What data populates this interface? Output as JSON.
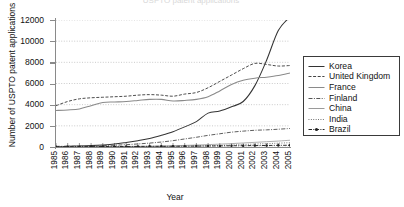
{
  "chart_data": {
    "type": "line",
    "title": "USPTO patent applications",
    "xlabel": "Year",
    "ylabel": "Number of USPTO patent applications",
    "xlim": [
      1985,
      2005
    ],
    "ylim": [
      0,
      12000
    ],
    "ytick_labels": [
      "12000",
      "10000",
      "8000",
      "6000",
      "4000",
      "2000",
      "0"
    ],
    "ytick_values": [
      12000,
      10000,
      8000,
      6000,
      4000,
      2000,
      0
    ],
    "grid": true,
    "legend_position": "right",
    "x": [
      1985,
      1986,
      1987,
      1988,
      1989,
      1990,
      1991,
      1992,
      1993,
      1994,
      1995,
      1996,
      1997,
      1998,
      1999,
      2000,
      2001,
      2002,
      2003,
      2004,
      2005
    ],
    "series": [
      {
        "name": "Korea",
        "style": "solid",
        "color": "#333333",
        "values": [
          40,
          60,
          90,
          130,
          190,
          280,
          430,
          600,
          800,
          1100,
          1450,
          1900,
          2400,
          3200,
          3400,
          3800,
          4300,
          5800,
          8200,
          11000,
          12300
        ]
      },
      {
        "name": "United Kingdom",
        "style": "dashed",
        "color": "#444444",
        "values": [
          3900,
          4300,
          4550,
          4650,
          4700,
          4750,
          4800,
          4900,
          4950,
          4900,
          4800,
          5000,
          5150,
          5600,
          6200,
          6800,
          7400,
          7900,
          7800,
          7650,
          7700
        ]
      },
      {
        "name": "France",
        "style": "solid",
        "color": "#8a8a8a",
        "values": [
          3450,
          3500,
          3600,
          3900,
          4200,
          4250,
          4300,
          4400,
          4500,
          4500,
          4350,
          4400,
          4500,
          4750,
          5300,
          5900,
          6300,
          6500,
          6600,
          6750,
          7000
        ]
      },
      {
        "name": "Finland",
        "style": "dash-dot",
        "color": "#555555",
        "values": [
          60,
          70,
          85,
          100,
          130,
          170,
          220,
          290,
          370,
          470,
          600,
          760,
          920,
          1100,
          1250,
          1400,
          1500,
          1580,
          1620,
          1680,
          1750
        ]
      },
      {
        "name": "China",
        "style": "solid-light",
        "color": "#9a9a9a",
        "values": [
          10,
          12,
          15,
          20,
          28,
          35,
          45,
          60,
          75,
          95,
          120,
          150,
          185,
          225,
          270,
          320,
          380,
          440,
          500,
          560,
          640
        ]
      },
      {
        "name": "India",
        "style": "dotted",
        "color": "#666666",
        "values": [
          8,
          9,
          10,
          12,
          15,
          18,
          22,
          28,
          35,
          45,
          58,
          75,
          95,
          120,
          150,
          190,
          235,
          280,
          320,
          360,
          410
        ]
      },
      {
        "name": "Brazil",
        "style": "dash-dot-marker",
        "color": "#222222",
        "values": [
          30,
          32,
          35,
          38,
          42,
          45,
          50,
          55,
          60,
          65,
          70,
          78,
          85,
          95,
          105,
          115,
          125,
          135,
          145,
          155,
          165
        ]
      }
    ],
    "legend": [
      {
        "label": "Korea",
        "style": "solid",
        "color": "#333333"
      },
      {
        "label": "United Kingdom",
        "style": "dashed",
        "color": "#444444"
      },
      {
        "label": "France",
        "style": "solid",
        "color": "#8a8a8a"
      },
      {
        "label": "Finland",
        "style": "dash-dot",
        "color": "#555555"
      },
      {
        "label": "China",
        "style": "solid-light",
        "color": "#9a9a9a"
      },
      {
        "label": "India",
        "style": "dotted",
        "color": "#666666"
      },
      {
        "label": "Brazil",
        "style": "dash-dot-marker",
        "color": "#222222"
      }
    ]
  }
}
